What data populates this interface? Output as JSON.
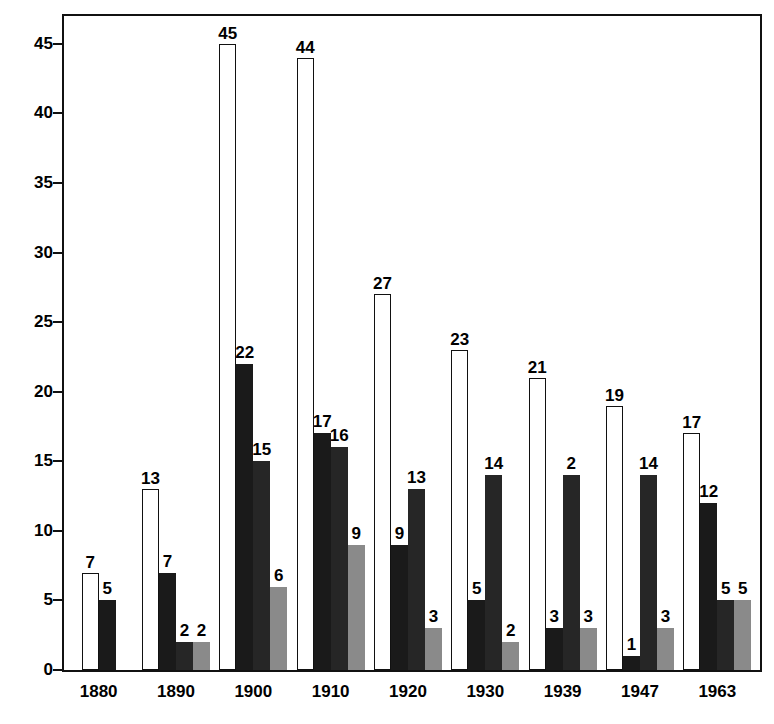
{
  "chart_data": {
    "type": "bar",
    "title": "",
    "subtitle": "",
    "xlabel": "",
    "ylabel": "",
    "ylim": [
      0,
      47
    ],
    "yticks": [
      0,
      5,
      10,
      15,
      20,
      25,
      30,
      35,
      40,
      45
    ],
    "grid": false,
    "legend": "none",
    "categories": [
      "1880",
      "1890",
      "1900",
      "1910",
      "1920",
      "1930",
      "1939",
      "1947",
      "1963"
    ],
    "series": [
      {
        "name": "series-1-white",
        "style": "white-outline",
        "color": "#ffffff",
        "values": [
          7,
          13,
          45,
          44,
          27,
          23,
          21,
          19,
          17
        ]
      },
      {
        "name": "series-2-black",
        "style": "solid-black",
        "color": "#1a1a1a",
        "values": [
          5,
          7,
          22,
          17,
          9,
          5,
          3,
          1,
          12
        ]
      },
      {
        "name": "series-3-dark",
        "style": "solid-dark",
        "color": "#262626",
        "values": [
          null,
          2,
          15,
          16,
          13,
          14,
          14,
          14,
          5
        ]
      },
      {
        "name": "series-4-gray",
        "style": "solid-gray",
        "color": "#8a8a8a",
        "values": [
          null,
          2,
          6,
          9,
          3,
          2,
          3,
          3,
          5
        ]
      }
    ],
    "bar_labels": [
      {
        "category": "1880",
        "labels": [
          "7",
          "5",
          "",
          ""
        ]
      },
      {
        "category": "1890",
        "labels": [
          "13",
          "7",
          "2",
          "2"
        ]
      },
      {
        "category": "1900",
        "labels": [
          "45",
          "22",
          "15",
          "6"
        ]
      },
      {
        "category": "1910",
        "labels": [
          "44",
          "17",
          "16",
          "9"
        ]
      },
      {
        "category": "1920",
        "labels": [
          "27",
          "9",
          "13",
          "3"
        ]
      },
      {
        "category": "1930",
        "labels": [
          "23",
          "5",
          "14",
          "2"
        ]
      },
      {
        "category": "1939",
        "labels": [
          "21",
          "3",
          "2",
          "3"
        ]
      },
      {
        "category": "1947",
        "labels": [
          "19",
          "1",
          "14",
          "3"
        ]
      },
      {
        "category": "1963",
        "labels": [
          "17",
          "12",
          "5",
          "5"
        ]
      }
    ]
  },
  "axis": {
    "y_ticks": [
      "45",
      "40",
      "35",
      "30",
      "25",
      "20",
      "15",
      "10",
      "5",
      "0"
    ],
    "x_ticks": [
      "1880",
      "1890",
      "1900",
      "1910",
      "1920",
      "1930",
      "1939",
      "1947",
      "1963"
    ]
  }
}
